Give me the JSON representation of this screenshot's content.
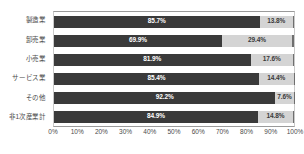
{
  "chart_data": {
    "type": "bar",
    "subtype": "stacked-horizontal-100pct",
    "title": "",
    "subtitle": "",
    "xlabel": "",
    "ylabel": "",
    "xlim": [
      0,
      100
    ],
    "xtick_labels": [
      "0%",
      "10%",
      "20%",
      "30%",
      "40%",
      "50%",
      "60%",
      "70%",
      "80%",
      "90%",
      "100%"
    ],
    "xtick_values": [
      0,
      10,
      20,
      30,
      40,
      50,
      60,
      70,
      80,
      90,
      100
    ],
    "grid": false,
    "legend": false,
    "legend_position": "none",
    "categories": [
      "製造業",
      "卸売業",
      "小売業",
      "サービス業",
      "その他",
      "非1次産業計"
    ],
    "series": [
      {
        "name": "primary",
        "color": "#3a3a3a",
        "values": [
          85.7,
          69.9,
          81.9,
          85.4,
          92.2,
          84.9
        ],
        "labels": [
          "85.7%",
          "69.9%",
          "81.9%",
          "85.4%",
          "92.2%",
          "84.9%"
        ]
      },
      {
        "name": "secondary",
        "color": "#d4d4d4",
        "values": [
          13.8,
          29.4,
          17.6,
          14.4,
          7.6,
          14.8
        ],
        "labels": [
          "13.8%",
          "29.4%",
          "17.6%",
          "14.4%",
          "7.6%",
          "14.8%"
        ]
      },
      {
        "name": "remainder",
        "color": "#6e6e6e",
        "values": [
          0.5,
          0.7,
          0.5,
          0.2,
          0.2,
          0.3
        ],
        "labels": [
          "",
          "",
          "",
          "",
          "",
          ""
        ]
      }
    ]
  }
}
